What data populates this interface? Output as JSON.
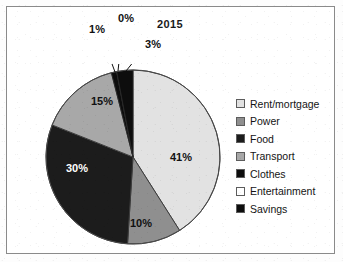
{
  "chart_data": {
    "type": "pie",
    "title": "2015",
    "categories": [
      "Rent/mortgage",
      "Power",
      "Food",
      "Transport",
      "Clothes",
      "Entertainment",
      "Savings"
    ],
    "values": [
      41,
      10,
      30,
      15,
      1,
      0,
      3
    ],
    "value_labels": [
      "41%",
      "10%",
      "30%",
      "15%",
      "1%",
      "0%",
      "3%"
    ],
    "unit": "%",
    "colors": [
      "#e2e2e2",
      "#8f8f8f",
      "#1c1c1c",
      "#a8a8a8",
      "#0d0d0d",
      "#ffffff",
      "#0d0d0d"
    ],
    "label_colors": [
      "dark",
      "dark",
      "light",
      "dark",
      "dark",
      "dark",
      "dark"
    ],
    "legend_position": "right",
    "grid": false,
    "start_angle_deg": 0,
    "direction": "clockwise"
  },
  "legend": {
    "items": [
      {
        "label": "Rent/mortgage",
        "color": "#e2e2e2"
      },
      {
        "label": "Power",
        "color": "#8f8f8f"
      },
      {
        "label": "Food",
        "color": "#1c1c1c"
      },
      {
        "label": "Transport",
        "color": "#a8a8a8"
      },
      {
        "label": "Clothes",
        "color": "#0d0d0d"
      },
      {
        "label": "Entertainment",
        "color": "#ffffff"
      },
      {
        "label": "Savings",
        "color": "#0d0d0d"
      }
    ]
  },
  "callouts": [
    {
      "label": "1%"
    },
    {
      "label": "0%"
    },
    {
      "label": "3%"
    }
  ],
  "inner_labels": [
    {
      "label": "41%"
    },
    {
      "label": "10%"
    },
    {
      "label": "30%"
    },
    {
      "label": "15%"
    }
  ]
}
